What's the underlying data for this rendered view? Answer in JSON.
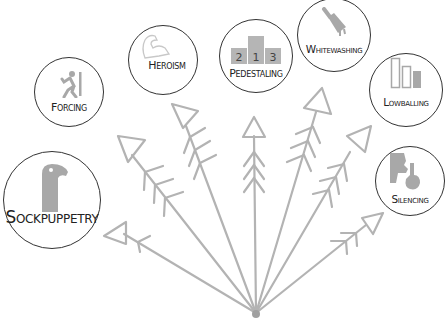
{
  "diagram": {
    "type": "radial-arrows",
    "origin": {
      "x": 256,
      "y": 314
    },
    "colors": {
      "arrow": "#b0b0b0",
      "icon": "#a8a8a8",
      "circle_stroke": "#333333",
      "label": "#222222"
    },
    "nodes": [
      {
        "id": "sockpuppetry",
        "label": "Sockpuppetry",
        "icon": "sock-puppet-icon"
      },
      {
        "id": "forcing",
        "label": "Forcing",
        "icon": "running-person-icon"
      },
      {
        "id": "heroism",
        "label": "Heroism",
        "icon": "flexed-arm-icon"
      },
      {
        "id": "pedestaling",
        "label": "Pedestaling",
        "icon": "podium-icon",
        "podium_numbers": [
          "2",
          "1",
          "3"
        ]
      },
      {
        "id": "whitewashing",
        "label": "Whitewashing",
        "icon": "paintbrush-icon"
      },
      {
        "id": "lowballing",
        "label": "Lowballing",
        "icon": "descending-bars-icon"
      },
      {
        "id": "silencing",
        "label": "Silencing",
        "icon": "shush-finger-icon"
      }
    ]
  }
}
